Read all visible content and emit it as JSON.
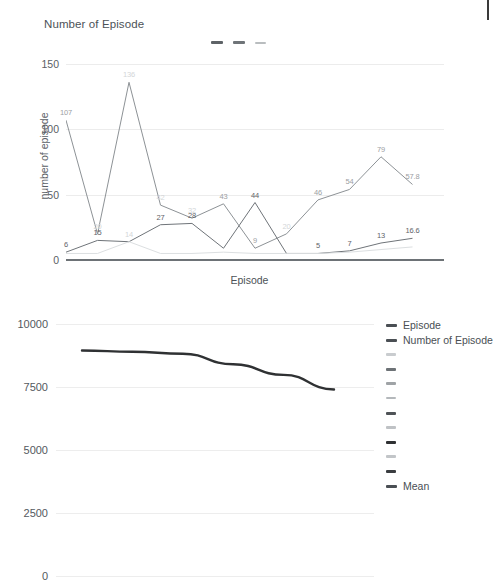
{
  "chart_data": [
    {
      "type": "line",
      "title": "Number of Episode",
      "xlabel": "Episode",
      "ylabel": "number of episode",
      "ylim": [
        0,
        150
      ],
      "yticks": [
        0,
        50,
        100,
        150
      ],
      "ytick_labels": [
        "0",
        "50",
        "100",
        "150"
      ],
      "grid": true,
      "legend_position": "top-center",
      "legend_labels": [
        "",
        "",
        ""
      ],
      "x": [
        1,
        2,
        3,
        4,
        5,
        6,
        7,
        8,
        9,
        10,
        11,
        12,
        13
      ],
      "series": [
        {
          "name": "series-1",
          "color": "#8d9296",
          "values": [
            107,
            20,
            136,
            42,
            32,
            43,
            9,
            20,
            46,
            54,
            79,
            57.8,
            null
          ],
          "labels": [
            "107",
            "20",
            "136",
            "42",
            "32",
            "43",
            "9",
            "20",
            "46",
            "54",
            "79",
            "57.8",
            ""
          ]
        },
        {
          "name": "series-2",
          "color": "#6f7479",
          "values": [
            6,
            15,
            14,
            27,
            28,
            9,
            44,
            5,
            5,
            7,
            13,
            16.6,
            null
          ],
          "labels": [
            "6",
            "15",
            "14",
            "27",
            "28",
            "9",
            "44",
            "5",
            "5",
            "7",
            "13",
            "16.6",
            ""
          ]
        },
        {
          "name": "series-3",
          "color": "#dcdfe1",
          "values": [
            5,
            5,
            14,
            5,
            5,
            6,
            5,
            5,
            5,
            6,
            8,
            10,
            null
          ],
          "labels": [
            "",
            "",
            "14",
            "5",
            "5",
            "",
            "",
            "",
            "",
            "",
            "",
            "10",
            ""
          ]
        }
      ],
      "point_labels": [
        {
          "text": "107",
          "x": 1,
          "y": 107,
          "tone": "mid"
        },
        {
          "text": "136",
          "x": 3,
          "y": 136,
          "tone": "light"
        },
        {
          "text": "20",
          "x": 2,
          "y": 20,
          "tone": "light"
        },
        {
          "text": "15",
          "x": 2,
          "y": 15,
          "tone": "dark"
        },
        {
          "text": "6",
          "x": 1,
          "y": 6,
          "tone": "dark"
        },
        {
          "text": "14",
          "x": 3,
          "y": 14,
          "tone": "light"
        },
        {
          "text": "42",
          "x": 4,
          "y": 42,
          "tone": "light"
        },
        {
          "text": "27",
          "x": 4,
          "y": 27,
          "tone": "dark"
        },
        {
          "text": "32",
          "x": 5,
          "y": 32,
          "tone": "light"
        },
        {
          "text": "28",
          "x": 5,
          "y": 28,
          "tone": "dark"
        },
        {
          "text": "43",
          "x": 6,
          "y": 43,
          "tone": "mid"
        },
        {
          "text": "9",
          "x": 7,
          "y": 9,
          "tone": "mid"
        },
        {
          "text": "44",
          "x": 7,
          "y": 44,
          "tone": "dark"
        },
        {
          "text": "20",
          "x": 8,
          "y": 20,
          "tone": "light"
        },
        {
          "text": "46",
          "x": 9,
          "y": 46,
          "tone": "mid"
        },
        {
          "text": "5",
          "x": 9,
          "y": 5,
          "tone": "dark"
        },
        {
          "text": "54",
          "x": 10,
          "y": 54,
          "tone": "mid"
        },
        {
          "text": "7",
          "x": 10,
          "y": 7,
          "tone": "dark"
        },
        {
          "text": "79",
          "x": 11,
          "y": 79,
          "tone": "mid"
        },
        {
          "text": "13",
          "x": 11,
          "y": 13,
          "tone": "dark"
        },
        {
          "text": "57.8",
          "x": 12,
          "y": 57.8,
          "tone": "mid"
        },
        {
          "text": "16.6",
          "x": 12,
          "y": 16.6,
          "tone": "dark"
        }
      ]
    },
    {
      "type": "line",
      "title": "",
      "xlabel": "",
      "ylabel": "",
      "ylim": [
        0,
        10000
      ],
      "yticks": [
        0,
        2500,
        5000,
        7500,
        10000
      ],
      "ytick_labels": [
        "0",
        "2500",
        "5000",
        "7500",
        "10000"
      ],
      "grid": true,
      "legend_position": "right",
      "x": [
        1,
        2,
        3,
        4,
        5,
        6
      ],
      "series": [
        {
          "name": "Mean",
          "color": "#2f3133",
          "values": [
            8950,
            8900,
            8820,
            8400,
            7980,
            7400
          ]
        }
      ],
      "legend_entries": [
        {
          "label": "Episode",
          "color": "#4a4f54",
          "width": 11,
          "height": 3
        },
        {
          "label": "Number of Episode",
          "color": "#4a4f54",
          "width": 11,
          "height": 3
        },
        {
          "label": "",
          "color": "#c9cccf",
          "width": 10,
          "height": 2.5
        },
        {
          "label": "",
          "color": "#6d7276",
          "width": 10,
          "height": 3
        },
        {
          "label": "",
          "color": "#9fa3a6",
          "width": 10,
          "height": 2.5
        },
        {
          "label": "",
          "color": "#b4b8bb",
          "width": 10,
          "height": 2.5
        },
        {
          "label": "",
          "color": "#4f5357",
          "width": 10,
          "height": 3
        },
        {
          "label": "",
          "color": "#bfc2c5",
          "width": 10,
          "height": 2.5
        },
        {
          "label": "",
          "color": "#2f3133",
          "width": 10,
          "height": 3.4
        },
        {
          "label": "",
          "color": "#c2c5c8",
          "width": 10,
          "height": 2.5
        },
        {
          "label": "",
          "color": "#3a3d40",
          "width": 10,
          "height": 3.2
        },
        {
          "label": "Mean",
          "color": "#4a4f54",
          "width": 11,
          "height": 3
        }
      ]
    }
  ],
  "chart1": {
    "title": "Number of Episode",
    "ylabel": "number of episode",
    "xlabel": "Episode",
    "yticks": [
      "150",
      "100",
      "50",
      "0"
    ]
  },
  "chart2": {
    "yticks": [
      "10000",
      "7500",
      "5000",
      "2500",
      "0"
    ]
  }
}
